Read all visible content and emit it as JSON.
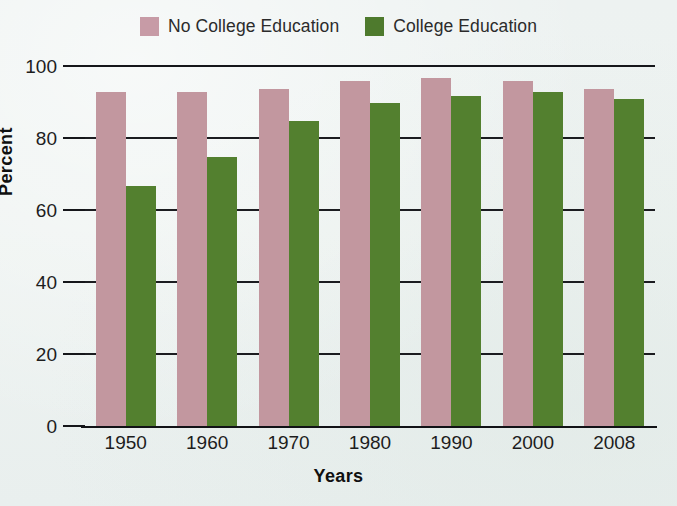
{
  "chart_data": {
    "type": "bar",
    "title": "",
    "xlabel": "Years",
    "ylabel": "Percent",
    "categories": [
      "1950",
      "1960",
      "1970",
      "1980",
      "1990",
      "2000",
      "2008"
    ],
    "series": [
      {
        "name": "No College Education",
        "color": "#c2979f",
        "values": [
          93,
          93,
          94,
          96,
          97,
          96,
          94
        ]
      },
      {
        "name": "College Education",
        "color": "#53802f",
        "values": [
          67,
          75,
          85,
          90,
          92,
          93,
          91
        ]
      }
    ],
    "ylim": [
      0,
      100
    ],
    "yticks": [
      0,
      20,
      40,
      60,
      80,
      100
    ],
    "ytick_labels": [
      "0",
      "20",
      "40",
      "60",
      "80",
      "100"
    ],
    "grid": true,
    "legend_position": "top-center"
  },
  "legend": {
    "entries": [
      {
        "label": "No College Education",
        "color": "#c79ba6"
      },
      {
        "label": "College Education",
        "color": "#4e7a2d"
      }
    ]
  },
  "axes": {
    "y_title": "Percent",
    "x_title": "Years"
  }
}
